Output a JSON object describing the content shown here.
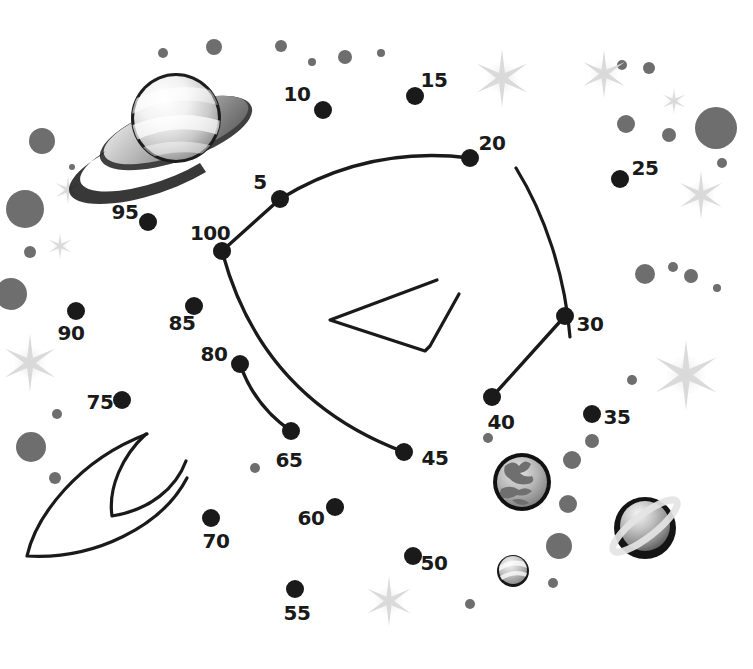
{
  "page": {
    "background_color": "#ffffff",
    "width": 753,
    "height": 669
  },
  "style": {
    "dot_color": "#1a1a1a",
    "line_color": "#1a1a1a",
    "label_color": "#1a1a1a",
    "star_color": "#d8d8d8",
    "speck_color": "#6e6e6e",
    "planet_dark": "#111111",
    "planet_light": "#f2f2f2"
  },
  "puzzle": {
    "type": "connect-the-dots",
    "dot_radius": 9,
    "label_font_size": 20,
    "dots": [
      {
        "number": "5",
        "x": 280,
        "y": 199,
        "label_x": 260,
        "label_y": 182
      },
      {
        "number": "10",
        "x": 323,
        "y": 110,
        "label_x": 297,
        "label_y": 94
      },
      {
        "number": "15",
        "x": 415,
        "y": 96,
        "label_x": 434,
        "label_y": 80
      },
      {
        "number": "20",
        "x": 470,
        "y": 158,
        "label_x": 492,
        "label_y": 143
      },
      {
        "number": "25",
        "x": 620,
        "y": 179,
        "label_x": 645,
        "label_y": 168
      },
      {
        "number": "30",
        "x": 565,
        "y": 316,
        "label_x": 590,
        "label_y": 324
      },
      {
        "number": "35",
        "x": 592,
        "y": 414,
        "label_x": 617,
        "label_y": 417
      },
      {
        "number": "40",
        "x": 492,
        "y": 397,
        "label_x": 501,
        "label_y": 422
      },
      {
        "number": "45",
        "x": 404,
        "y": 452,
        "label_x": 435,
        "label_y": 458
      },
      {
        "number": "50",
        "x": 413,
        "y": 556,
        "label_x": 434,
        "label_y": 563
      },
      {
        "number": "55",
        "x": 295,
        "y": 589,
        "label_x": 297,
        "label_y": 613
      },
      {
        "number": "60",
        "x": 335,
        "y": 507,
        "label_x": 311,
        "label_y": 518
      },
      {
        "number": "65",
        "x": 291,
        "y": 431,
        "label_x": 289,
        "label_y": 460
      },
      {
        "number": "70",
        "x": 211,
        "y": 518,
        "label_x": 216,
        "label_y": 541
      },
      {
        "number": "75",
        "x": 122,
        "y": 400,
        "label_x": 100,
        "label_y": 402
      },
      {
        "number": "80",
        "x": 240,
        "y": 364,
        "label_x": 214,
        "label_y": 354
      },
      {
        "number": "85",
        "x": 194,
        "y": 306,
        "label_x": 182,
        "label_y": 323
      },
      {
        "number": "90",
        "x": 76,
        "y": 311,
        "label_x": 71,
        "label_y": 333
      },
      {
        "number": "95",
        "x": 148,
        "y": 222,
        "label_x": 125,
        "label_y": 212
      },
      {
        "number": "100",
        "x": 222,
        "y": 251,
        "label_x": 210,
        "label_y": 233
      }
    ],
    "connections": [
      {
        "from": "100",
        "to": "5",
        "kind": "line"
      },
      {
        "from": "5",
        "to": "20",
        "kind": "curve"
      },
      {
        "from": "100",
        "to": "45",
        "kind": "curve"
      },
      {
        "from": "80",
        "to": "65",
        "kind": "curve"
      },
      {
        "from": "30",
        "to": "40",
        "kind": "line"
      }
    ],
    "loose_strokes": [
      {
        "name": "rocket-nose-arc",
        "d": "M 516 168 C 545 215 565 275 570 337"
      },
      {
        "name": "rocket-fin-chevron",
        "d": "M 437 280 L 330 320 L 425 351 L 430 346 L 459 294"
      },
      {
        "name": "flame-outer",
        "d": "M 147 434 C 78 460 36 516 27 556 C 95 560 162 526 187 478"
      },
      {
        "name": "flame-inner",
        "d": "M 146 434 C 122 456 108 488 112 516 C 150 510 176 488 186 461"
      }
    ]
  },
  "decor": {
    "planets": [
      {
        "name": "saturn-planet-large",
        "cx": 176,
        "cy": 126,
        "r": 46
      },
      {
        "name": "earth-planet",
        "cx": 522,
        "cy": 482,
        "r": 29
      },
      {
        "name": "ringed-planet-small",
        "cx": 645,
        "cy": 528,
        "r": 31
      },
      {
        "name": "marble-planet",
        "cx": 513,
        "cy": 571,
        "r": 16
      }
    ],
    "stars": [
      {
        "cx": 502,
        "cy": 78,
        "r": 29
      },
      {
        "cx": 604,
        "cy": 74,
        "r": 24
      },
      {
        "cx": 674,
        "cy": 101,
        "r": 13
      },
      {
        "cx": 701,
        "cy": 195,
        "r": 24
      },
      {
        "cx": 686,
        "cy": 375,
        "r": 35
      },
      {
        "cx": 68,
        "cy": 190,
        "r": 14
      },
      {
        "cx": 60,
        "cy": 246,
        "r": 13
      },
      {
        "cx": 30,
        "cy": 363,
        "r": 29
      },
      {
        "cx": 389,
        "cy": 601,
        "r": 25
      }
    ],
    "specks": [
      {
        "cx": 163,
        "cy": 53,
        "r": 5
      },
      {
        "cx": 214,
        "cy": 47,
        "r": 8
      },
      {
        "cx": 281,
        "cy": 46,
        "r": 6
      },
      {
        "cx": 312,
        "cy": 62,
        "r": 4
      },
      {
        "cx": 345,
        "cy": 57,
        "r": 7
      },
      {
        "cx": 381,
        "cy": 53,
        "r": 4
      },
      {
        "cx": 42,
        "cy": 141,
        "r": 13
      },
      {
        "cx": 25,
        "cy": 209,
        "r": 19
      },
      {
        "cx": 72,
        "cy": 167,
        "r": 3
      },
      {
        "cx": 30,
        "cy": 252,
        "r": 6
      },
      {
        "cx": 11,
        "cy": 294,
        "r": 16
      },
      {
        "cx": 57,
        "cy": 414,
        "r": 5
      },
      {
        "cx": 31,
        "cy": 447,
        "r": 15
      },
      {
        "cx": 622,
        "cy": 65,
        "r": 5
      },
      {
        "cx": 649,
        "cy": 68,
        "r": 6
      },
      {
        "cx": 626,
        "cy": 124,
        "r": 9
      },
      {
        "cx": 669,
        "cy": 135,
        "r": 7
      },
      {
        "cx": 716,
        "cy": 128,
        "r": 21
      },
      {
        "cx": 722,
        "cy": 163,
        "r": 5
      },
      {
        "cx": 645,
        "cy": 274,
        "r": 10
      },
      {
        "cx": 673,
        "cy": 267,
        "r": 5
      },
      {
        "cx": 691,
        "cy": 276,
        "r": 7
      },
      {
        "cx": 717,
        "cy": 288,
        "r": 4
      },
      {
        "cx": 632,
        "cy": 380,
        "r": 5
      },
      {
        "cx": 488,
        "cy": 438,
        "r": 5
      },
      {
        "cx": 592,
        "cy": 441,
        "r": 7
      },
      {
        "cx": 572,
        "cy": 460,
        "r": 9
      },
      {
        "cx": 568,
        "cy": 504,
        "r": 9
      },
      {
        "cx": 559,
        "cy": 546,
        "r": 13
      },
      {
        "cx": 470,
        "cy": 604,
        "r": 5
      },
      {
        "cx": 553,
        "cy": 583,
        "r": 5
      },
      {
        "cx": 255,
        "cy": 468,
        "r": 5
      },
      {
        "cx": 55,
        "cy": 478,
        "r": 6
      }
    ]
  }
}
